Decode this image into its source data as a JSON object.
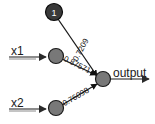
{
  "diagram": {
    "type": "neural-network",
    "title": "",
    "background_color": "#ffffff",
    "nodes": [
      {
        "id": "bias",
        "label": "1",
        "role": "bias-node",
        "cx": 54,
        "cy": 12,
        "r": 8,
        "fill": "#3a3a3a",
        "stroke": "#111111",
        "label_color": "#ffffff"
      },
      {
        "id": "hidden-x1",
        "label": "",
        "role": "hidden-node-x1",
        "cx": 56,
        "cy": 56,
        "r": 7,
        "fill": "#787878",
        "stroke": "#1a1a1a",
        "label_color": "#ffffff"
      },
      {
        "id": "hidden-x2",
        "label": "",
        "role": "hidden-node-x2",
        "cx": 56,
        "cy": 108,
        "r": 7,
        "fill": "#787878",
        "stroke": "#1a1a1a",
        "label_color": "#ffffff"
      },
      {
        "id": "output",
        "label": "",
        "role": "output-node",
        "cx": 103,
        "cy": 79,
        "r": 7,
        "fill": "#787878",
        "stroke": "#1a1a1a",
        "label_color": "#ffffff"
      }
    ],
    "inputs": [
      {
        "id": "x1",
        "label": "x1",
        "label_x": 11,
        "label_y": 54,
        "line_x1": 9,
        "line_y1": 57,
        "line_x2": 47,
        "line_y2": 57
      },
      {
        "id": "x2",
        "label": "x2",
        "label_x": 11,
        "label_y": 106,
        "line_x1": 9,
        "line_y1": 109,
        "line_x2": 47,
        "line_y2": 109
      }
    ],
    "edges": [
      {
        "id": "bias-to-output",
        "from": "bias",
        "to": "output",
        "weight": "0.7209",
        "label_x": 83,
        "label_y": 50,
        "label_rotation": -64
      },
      {
        "id": "hidden-x1-to-output",
        "from": "hidden-x1",
        "to": "output",
        "weight": "0.87571",
        "label_x": 66,
        "label_y": 64,
        "label_rotation": 28
      },
      {
        "id": "hidden-x2-to-output",
        "from": "hidden-x2",
        "to": "output",
        "weight": "0.76098",
        "label_x": 63,
        "label_y": 101,
        "label_rotation": -30
      }
    ],
    "output": {
      "label": "output",
      "label_x": 116,
      "label_y": 77,
      "line_x1": 110,
      "line_y1": 79,
      "line_x2": 150,
      "line_y2": 79
    },
    "colors": {
      "line": "#555555",
      "edge": "#1a1a1a",
      "text": "#1a1a1a",
      "node_dark": "#3a3a3a",
      "node_gray": "#787878"
    }
  }
}
